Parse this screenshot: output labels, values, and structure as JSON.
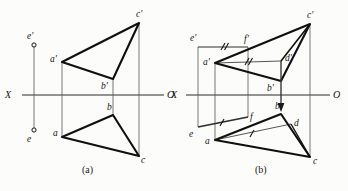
{
  "figure": {
    "background_color": "#fcfcfa",
    "ink_color": "#141414",
    "thin_color": "#4a4a4a",
    "captions": [
      {
        "text": "(a)",
        "x": 82,
        "y": 172
      },
      {
        "text": "(b)",
        "x": 255,
        "y": 172
      }
    ]
  },
  "panel_a": {
    "name": "projection-diagram-a",
    "axis": {
      "label_left": "X",
      "label_right": "O",
      "x1": 22,
      "x2": 164,
      "y": 95,
      "label_left_x": 8,
      "label_left_y": 98,
      "label_right_x": 167,
      "label_right_y": 98
    },
    "vertices": {
      "a_prime": {
        "label": "a'",
        "x": 62,
        "y": 62,
        "label_x": 50,
        "label_y": 62
      },
      "b_prime": {
        "label": "b'",
        "x": 113,
        "y": 79,
        "label_x": 101,
        "label_y": 89
      },
      "c_prime": {
        "label": "c'",
        "x": 139,
        "y": 23,
        "label_x": 136,
        "label_y": 17
      },
      "a": {
        "label": "a",
        "x": 62,
        "y": 137,
        "label_x": 53,
        "label_y": 136
      },
      "b": {
        "label": "b",
        "x": 113,
        "y": 115,
        "label_x": 107,
        "label_y": 110
      },
      "c": {
        "label": "c",
        "x": 139,
        "y": 156,
        "label_x": 141,
        "label_y": 163
      },
      "e_prime": {
        "label": "e'",
        "x": 34,
        "y": 45,
        "label_x": 27,
        "label_y": 39
      },
      "e": {
        "label": "e",
        "x": 34,
        "y": 130,
        "label_x": 27,
        "label_y": 140
      }
    },
    "vertical_connectors": [
      {
        "name": "connector-a",
        "x": 62,
        "y1": 62,
        "y2": 137
      },
      {
        "name": "connector-b",
        "x": 113,
        "y1": 79,
        "y2": 115
      },
      {
        "name": "connector-c",
        "x": 139,
        "y1": 23,
        "y2": 156
      },
      {
        "name": "connector-e",
        "x": 34,
        "y1": 45,
        "y2": 130
      }
    ]
  },
  "panel_b": {
    "name": "projection-diagram-b",
    "axis": {
      "label_left": "X",
      "label_right": "O",
      "x1": 186,
      "x2": 330,
      "y": 95,
      "label_left_x": 174,
      "label_left_y": 98,
      "label_right_x": 333,
      "label_right_y": 98
    },
    "vertices": {
      "a_prime": {
        "label": "a'",
        "x": 215,
        "y": 63,
        "label_x": 203,
        "label_y": 63
      },
      "b_prime": {
        "label": "b'",
        "x": 281,
        "y": 81,
        "label_x": 269,
        "label_y": 90
      },
      "c_prime": {
        "label": "c'",
        "x": 310,
        "y": 24,
        "label_x": 307,
        "label_y": 18
      },
      "d_prime": {
        "label": "d'",
        "x": 281,
        "y": 61,
        "label_x": 285,
        "label_y": 61
      },
      "e_prime": {
        "label": "e'",
        "x": 198,
        "y": 47,
        "label_x": 191,
        "label_y": 41
      },
      "f_prime": {
        "label": "f'",
        "x": 248,
        "y": 47,
        "label_x": 245,
        "label_y": 42
      },
      "a": {
        "label": "a",
        "x": 215,
        "y": 140,
        "label_x": 206,
        "label_y": 141
      },
      "b": {
        "label": "b",
        "x": 281,
        "y": 114,
        "label_x": 275,
        "label_y": 109
      },
      "c": {
        "label": "c",
        "x": 310,
        "y": 157,
        "label_x": 313,
        "label_y": 163
      },
      "d": {
        "label": "d",
        "x": 291,
        "y": 124,
        "label_x": 294,
        "label_y": 124
      },
      "e": {
        "label": "e",
        "x": 198,
        "y": 127,
        "label_x": 191,
        "label_y": 136
      },
      "f": {
        "label": "f",
        "x": 248,
        "y": 117,
        "label_x": 250,
        "label_y": 118
      }
    },
    "vertical_connectors": [
      {
        "name": "connector-a",
        "x": 215,
        "y1": 63,
        "y2": 140
      },
      {
        "name": "connector-c",
        "x": 310,
        "y1": 24,
        "y2": 157
      },
      {
        "name": "connector-e",
        "x": 198,
        "y1": 47,
        "y2": 127
      },
      {
        "name": "connector-f",
        "x": 248,
        "y1": 47,
        "y2": 117
      }
    ],
    "projection_arrow": {
      "name": "projection-arrow-d",
      "x": 281,
      "y1": 61,
      "y2": 110
    },
    "tick_marks": {
      "ef_prime": {
        "count": 2,
        "label": "double-tick"
      },
      "ad_prime": {
        "count": 2,
        "label": "double-tick"
      },
      "ef": {
        "count": 1,
        "label": "single-tick"
      },
      "ad": {
        "count": 1,
        "label": "single-tick"
      }
    }
  }
}
